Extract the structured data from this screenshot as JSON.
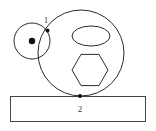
{
  "figure": {
    "background_color": "#ffffff",
    "stroke_color": "#2b2b2b",
    "dot_color": "#111111",
    "width": 156,
    "height": 131,
    "labels": {
      "small_wheel": "1",
      "base_plate": "2"
    },
    "parts": [
      {
        "name": "small-wheel",
        "shape": "circle",
        "label": "1",
        "cx": 32,
        "cy": 41,
        "r": 18
      },
      {
        "name": "small-wheel-hub",
        "shape": "filled-dot",
        "cx": 32,
        "cy": 41,
        "r": 3
      },
      {
        "name": "contact-point-wheels",
        "shape": "filled-dot",
        "cx": 48,
        "cy": 30,
        "r": 2
      },
      {
        "name": "large-drum",
        "shape": "circle",
        "cx": 81,
        "cy": 53,
        "r": 43
      },
      {
        "name": "drum-window-ellipse",
        "shape": "ellipse",
        "cx": 91,
        "cy": 36,
        "rx": 19,
        "ry": 10
      },
      {
        "name": "drum-hexagon-bore",
        "shape": "hexagon",
        "cx": 90,
        "cy": 70,
        "r": 18,
        "orientation": "flat-top"
      },
      {
        "name": "contact-point-base",
        "shape": "filled-dot",
        "cx": 80,
        "cy": 96,
        "r": 2
      },
      {
        "name": "base-plate",
        "shape": "rectangle",
        "label": "2",
        "x": 10,
        "y": 96,
        "width": 136,
        "height": 26
      }
    ]
  }
}
